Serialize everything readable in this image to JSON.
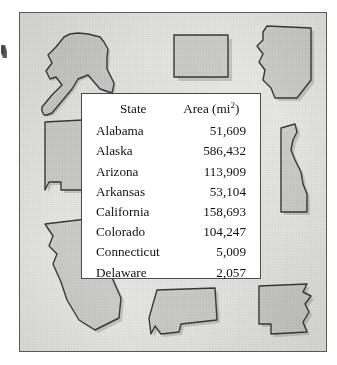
{
  "figure": {
    "table": {
      "columns": {
        "state": "State",
        "area_label": "Area (mi",
        "area_exponent": "2",
        "area_label_close": ")"
      },
      "rows": [
        {
          "state": "Alabama",
          "area": "51,609"
        },
        {
          "state": "Alaska",
          "area": "586,432"
        },
        {
          "state": "Arizona",
          "area": "113,909"
        },
        {
          "state": "Arkansas",
          "area": "53,104"
        },
        {
          "state": "California",
          "area": "158,693"
        },
        {
          "state": "Colorado",
          "area": "104,247"
        },
        {
          "state": "Connecticut",
          "area": "5,009"
        },
        {
          "state": "Delaware",
          "area": "2,057"
        }
      ]
    },
    "map_shapes": [
      {
        "name": "alaska",
        "label": "Alaska"
      },
      {
        "name": "colorado",
        "label": "Colorado"
      },
      {
        "name": "arizona",
        "label": "Arizona"
      },
      {
        "name": "alabama",
        "label": "Alabama"
      },
      {
        "name": "delaware",
        "label": "Delaware"
      },
      {
        "name": "california",
        "label": "California"
      },
      {
        "name": "connecticut",
        "label": "Connecticut"
      },
      {
        "name": "arkansas",
        "label": "Arkansas"
      }
    ],
    "colors": {
      "background": "#e9e9e7",
      "shape_fill": "#cfcfcd",
      "shape_outline": "#3a3a3a",
      "card_background": "#ffffff",
      "frame_border": "#595959",
      "text": "#111111"
    }
  }
}
